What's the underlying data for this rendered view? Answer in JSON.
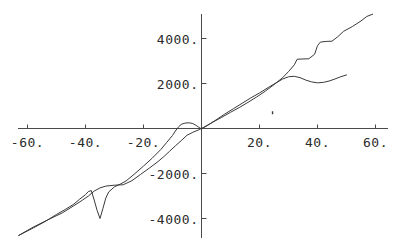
{
  "chart_data": {
    "type": "line",
    "title": "",
    "subtitle": "",
    "xlabel": "",
    "ylabel": "",
    "xlim": [
      -66,
      62
    ],
    "ylim": [
      -4800,
      5200
    ],
    "grid": false,
    "legend": "none",
    "axes_style": "crossing-at-origin",
    "xticks": [
      -60,
      -40,
      -20,
      20,
      40,
      60
    ],
    "yticks": [
      4000,
      2000,
      -2000,
      -4000
    ],
    "xtick_labels": [
      "-60.",
      "-40.",
      "-20.",
      "20.",
      "40.",
      "60."
    ],
    "ytick_labels": [
      "4000.",
      "2000.",
      "-2000.",
      "-4000."
    ],
    "series": [
      {
        "name": "curve-1",
        "comment": "long curve spanning full range, stepped plateaus on the right",
        "x": [
          -63,
          -58,
          -53,
          -48,
          -44,
          -41,
          -39,
          -37,
          -35,
          -33,
          -30,
          -27,
          -24,
          -21,
          -18,
          -15,
          -13,
          -11,
          -9,
          -7,
          -5,
          -3,
          -1,
          1,
          4,
          7,
          10,
          13,
          16,
          19,
          22,
          25,
          28,
          30,
          32,
          33,
          35,
          37,
          39,
          40,
          41,
          43,
          45,
          47,
          49,
          52,
          55,
          57,
          59
        ],
        "y": [
          -4750,
          -4380,
          -4060,
          -3750,
          -3430,
          -3180,
          -3000,
          -2780,
          -2640,
          -2560,
          -2520,
          -2500,
          -2320,
          -2040,
          -1760,
          -1470,
          -1250,
          -1010,
          -770,
          -540,
          -300,
          -170,
          -60,
          70,
          290,
          500,
          720,
          930,
          1160,
          1400,
          1660,
          1950,
          2260,
          2530,
          2830,
          3080,
          3090,
          3100,
          3300,
          3680,
          3840,
          3870,
          3880,
          4080,
          4320,
          4530,
          4780,
          4980,
          5080
        ]
      },
      {
        "name": "curve-2",
        "comment": "curve with sharp V notch near x=-37 and flattening tail ending at x=50",
        "x": [
          -63,
          -58,
          -54,
          -50,
          -47,
          -44,
          -42,
          -40,
          -39,
          -38,
          -37,
          -36,
          -35,
          -34,
          -33,
          -32,
          -30,
          -28,
          -26,
          -23,
          -20,
          -17,
          -14,
          -12,
          -10,
          -9,
          -8,
          -7,
          -6,
          -5,
          -4,
          -3,
          -2,
          -1,
          0,
          2,
          5,
          8,
          11,
          14,
          17,
          20,
          23,
          26,
          28,
          30,
          32,
          34,
          36,
          38,
          40,
          42,
          44,
          46,
          48,
          50
        ],
        "y": [
          -4750,
          -4420,
          -4140,
          -3820,
          -3600,
          -3360,
          -3140,
          -2940,
          -2800,
          -2760,
          -3180,
          -3640,
          -4000,
          -3560,
          -3090,
          -2820,
          -2590,
          -2470,
          -2330,
          -2010,
          -1670,
          -1320,
          -930,
          -620,
          -310,
          -110,
          60,
          180,
          230,
          250,
          250,
          220,
          150,
          60,
          -20,
          130,
          380,
          640,
          880,
          1120,
          1360,
          1580,
          1820,
          2050,
          2200,
          2300,
          2320,
          2260,
          2150,
          2070,
          2030,
          2050,
          2110,
          2200,
          2300,
          2380
        ]
      }
    ],
    "annotations": [
      {
        "name": "stray-mark",
        "x": 24.5,
        "y": 700
      }
    ],
    "style": {
      "line_color": "#3a3a3a",
      "axis_color": "#4a4a4a",
      "background": "#ffffff"
    }
  }
}
